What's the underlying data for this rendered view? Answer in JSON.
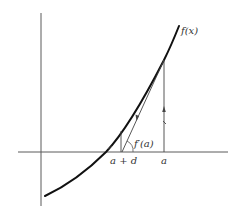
{
  "diagram": {
    "type": "newton-method-geometry",
    "labels": {
      "curve": "f(x)",
      "tangent_slope": "f′(a)",
      "point_a": "a",
      "point_a_plus_d": "a + d"
    },
    "elements": {
      "axes": [
        "x-axis",
        "y-axis"
      ],
      "curve": "f(x) increasing convex curve crossing x-axis",
      "vertical_line_at_a": "from x-axis up to f(a), with upward arrow",
      "tangent_line": "tangent at (a, f(a)) meeting x-axis at a + d, with arrow pointing down along it",
      "vertical_line_at_a_plus_d": "from x-axis up to f(a + d)",
      "angle_arc": "marks slope angle f′(a) at x-axis intersection"
    },
    "colors": {
      "curve": "#111111",
      "lines": "#444444",
      "axes": "#5a5a5a",
      "background": "#ffffff"
    }
  }
}
